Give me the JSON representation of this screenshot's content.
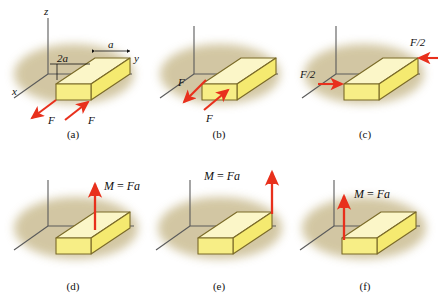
{
  "figure": {
    "background_color": "#ffffff",
    "colors": {
      "block_top": "#fbf6c8",
      "block_side": "#f5ea70",
      "block_end": "#f7ee86",
      "block_outline": "#7a6a28",
      "shadow": "#cbbd93",
      "arrow_red": "#e8301c",
      "axis_line": "#5a5a5a",
      "text": "#111111"
    },
    "axes": {
      "z_label": "z",
      "x_label": "x",
      "y_label": "y"
    },
    "dimensions": {
      "length_label": "2a",
      "width_label": "a"
    },
    "panels": [
      {
        "id": "a",
        "caption": "(a)",
        "show_axis_labels": true,
        "show_dimensions": true,
        "annotations": [
          {
            "name": "force-label-left",
            "text": "F"
          },
          {
            "name": "force-label-right",
            "text": "F"
          }
        ]
      },
      {
        "id": "b",
        "caption": "(b)",
        "show_axis_labels": false,
        "show_dimensions": false,
        "annotations": [
          {
            "name": "force-label-left",
            "text": "F"
          },
          {
            "name": "force-label-bottom",
            "text": "F"
          }
        ]
      },
      {
        "id": "c",
        "caption": "(c)",
        "show_axis_labels": false,
        "show_dimensions": false,
        "annotations": [
          {
            "name": "half-force-label-upper",
            "text": "F/2"
          },
          {
            "name": "half-force-label-lower",
            "text": "F/2"
          }
        ]
      },
      {
        "id": "d",
        "caption": "(d)",
        "show_axis_labels": false,
        "show_dimensions": false,
        "annotations": [
          {
            "name": "moment-label",
            "text": "M = Fa"
          }
        ]
      },
      {
        "id": "e",
        "caption": "(e)",
        "show_axis_labels": false,
        "show_dimensions": false,
        "annotations": [
          {
            "name": "moment-label",
            "text": "M = Fa"
          }
        ]
      },
      {
        "id": "f",
        "caption": "(f)",
        "show_axis_labels": false,
        "show_dimensions": false,
        "annotations": [
          {
            "name": "moment-label",
            "text": "M = Fa"
          }
        ]
      }
    ]
  }
}
